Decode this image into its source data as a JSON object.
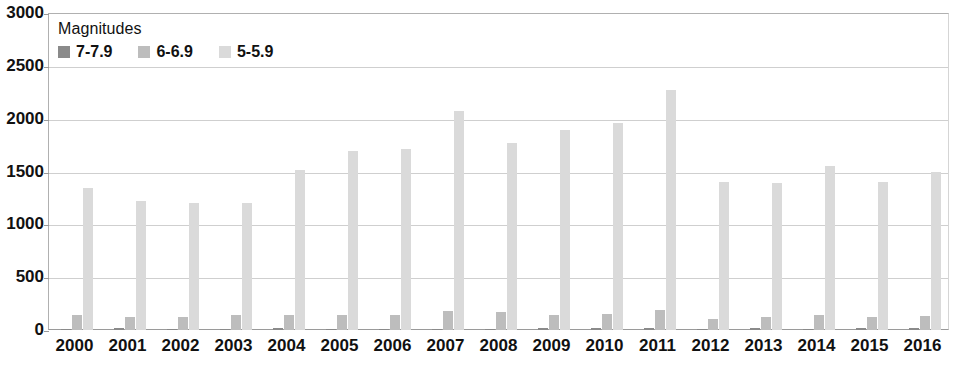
{
  "chart_data": {
    "type": "bar",
    "title": "",
    "xlabel": "",
    "ylabel": "",
    "ylim": [
      0,
      3000
    ],
    "ytick_step": 500,
    "yticks": [
      "0",
      "500",
      "1000",
      "1500",
      "2000",
      "2500",
      "3000"
    ],
    "grid": true,
    "legend_position": "top-left",
    "legend_title": "Magnitudes",
    "categories": [
      "2000",
      "2001",
      "2002",
      "2003",
      "2004",
      "2005",
      "2006",
      "2007",
      "2008",
      "2009",
      "2010",
      "2011",
      "2012",
      "2013",
      "2014",
      "2015",
      "2016"
    ],
    "series": [
      {
        "name": "7-7.9",
        "color": "#8a8a8a",
        "values": [
          14,
          15,
          13,
          14,
          16,
          11,
          10,
          14,
          12,
          16,
          23,
          19,
          12,
          17,
          11,
          19,
          16
        ]
      },
      {
        "name": "6-6.9",
        "color": "#bdbdbd",
        "values": [
          146,
          121,
          127,
          140,
          141,
          140,
          142,
          178,
          168,
          144,
          150,
          185,
          108,
          123,
          143,
          127,
          128
        ]
      },
      {
        "name": "5-5.9",
        "color": "#dadada",
        "values": [
          1344,
          1224,
          1201,
          1203,
          1515,
          1693,
          1712,
          2074,
          1768,
          1896,
          1963,
          2271,
          1401,
          1395,
          1549,
          1400,
          1491
        ]
      }
    ]
  }
}
